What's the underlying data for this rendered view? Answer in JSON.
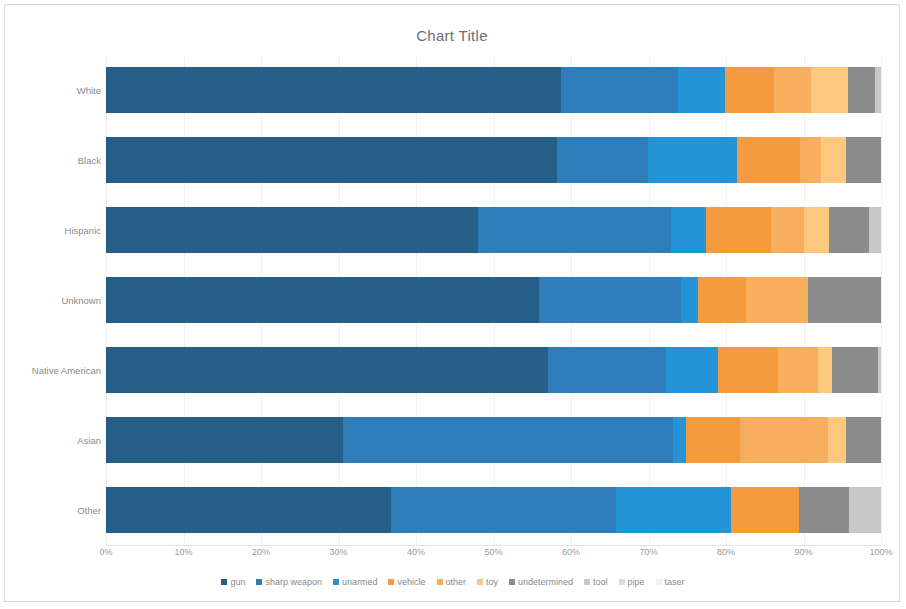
{
  "chart_data": {
    "type": "bar",
    "title": "Chart Title",
    "orientation": "horizontal",
    "stacked": true,
    "stack_mode": "100%",
    "xlabel": "",
    "ylabel": "",
    "xlim": [
      0,
      100
    ],
    "xticks": [
      "0%",
      "10%",
      "20%",
      "30%",
      "40%",
      "50%",
      "60%",
      "70%",
      "80%",
      "90%",
      "100%"
    ],
    "grid": true,
    "legend_position": "bottom",
    "categories": [
      "White",
      "Black",
      "Hispanic",
      "Unknown",
      "Native American",
      "Asian",
      "Other"
    ],
    "series": [
      {
        "name": "gun",
        "color": "#255E86",
        "values": [
          58.7,
          58.3,
          48.0,
          55.9,
          57.0,
          30.7,
          36.8
        ]
      },
      {
        "name": "sharp weapon",
        "color": "#2E7DB8",
        "values": [
          15.1,
          11.7,
          24.9,
          18.3,
          15.2,
          42.8,
          29.0
        ]
      },
      {
        "name": "unarmed",
        "color": "#2494D6",
        "values": [
          6.1,
          11.5,
          4.5,
          2.2,
          6.8,
          1.7,
          14.8
        ]
      },
      {
        "name": "vehicle",
        "color": "#F59B3F",
        "values": [
          6.3,
          8.1,
          8.4,
          6.2,
          7.7,
          7.0,
          8.8
        ]
      },
      {
        "name": "other",
        "color": "#F7AE5E",
        "values": [
          4.8,
          2.8,
          4.3,
          8.0,
          5.2,
          11.4,
          0.0
        ]
      },
      {
        "name": "toy",
        "color": "#FBC87E",
        "values": [
          4.8,
          3.2,
          3.2,
          0.0,
          1.8,
          2.3,
          0.0
        ]
      },
      {
        "name": "undetermined",
        "color": "#8C8C8C",
        "values": [
          3.4,
          4.5,
          5.2,
          9.4,
          5.9,
          4.5,
          6.5
        ]
      },
      {
        "name": "tool",
        "color": "#C8C8C8",
        "values": [
          0.8,
          0.0,
          1.5,
          0.0,
          0.4,
          0.0,
          4.1
        ]
      },
      {
        "name": "pipe",
        "color": "#DCDCDC",
        "values": [
          0.0,
          0.0,
          0.0,
          0.0,
          0.0,
          0.0,
          0.0
        ]
      },
      {
        "name": "taser",
        "color": "#F2F2F2",
        "values": [
          0.0,
          0.0,
          0.0,
          0.0,
          0.0,
          0.0,
          0.0
        ]
      }
    ]
  }
}
